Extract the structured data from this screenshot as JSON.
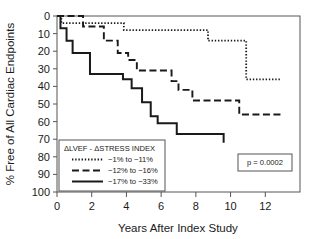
{
  "chart_data": {
    "type": "line",
    "subtype": "kaplan-meier-step",
    "title": "",
    "xlabel": "Years After Index Study",
    "ylabel": "% Free of All Cardiac Endpoints",
    "xlim": [
      0,
      14
    ],
    "ylim": [
      0,
      100
    ],
    "xticks": [
      0,
      2,
      4,
      6,
      8,
      10,
      12
    ],
    "yticks": [
      0,
      10,
      20,
      30,
      40,
      50,
      60,
      70,
      80,
      90,
      100
    ],
    "grid": false,
    "legend_position": "lower-left",
    "annotations": [
      {
        "name": "p-value",
        "text": "p = 0.0002",
        "boxed": true
      }
    ],
    "series": [
      {
        "name": "-1% to -11%",
        "style": "dotted",
        "color": "#1a1a1a",
        "points": [
          [
            0.0,
            100
          ],
          [
            0.25,
            100
          ],
          [
            0.25,
            96
          ],
          [
            3.85,
            96
          ],
          [
            3.85,
            92
          ],
          [
            8.7,
            92
          ],
          [
            8.7,
            86
          ],
          [
            10.9,
            86
          ],
          [
            10.9,
            64
          ],
          [
            12.9,
            64
          ]
        ]
      },
      {
        "name": "-12% to -16%",
        "style": "dashed",
        "color": "#1a1a1a",
        "points": [
          [
            0.0,
            100
          ],
          [
            1.5,
            100
          ],
          [
            1.5,
            94
          ],
          [
            2.7,
            94
          ],
          [
            2.7,
            86
          ],
          [
            3.5,
            86
          ],
          [
            3.5,
            79
          ],
          [
            4.1,
            79
          ],
          [
            4.1,
            75
          ],
          [
            4.6,
            75
          ],
          [
            4.6,
            69
          ],
          [
            6.6,
            69
          ],
          [
            6.6,
            63
          ],
          [
            7.0,
            63
          ],
          [
            7.0,
            58
          ],
          [
            7.8,
            58
          ],
          [
            7.8,
            52
          ],
          [
            10.5,
            52
          ],
          [
            10.5,
            44
          ],
          [
            12.9,
            44
          ]
        ]
      },
      {
        "name": "-17% to -33%",
        "style": "solid",
        "color": "#1a1a1a",
        "points": [
          [
            0.0,
            100
          ],
          [
            0.2,
            100
          ],
          [
            0.2,
            93
          ],
          [
            0.55,
            93
          ],
          [
            0.55,
            86
          ],
          [
            0.9,
            86
          ],
          [
            0.9,
            79
          ],
          [
            1.9,
            79
          ],
          [
            1.9,
            67
          ],
          [
            3.8,
            67
          ],
          [
            3.8,
            64
          ],
          [
            4.3,
            64
          ],
          [
            4.3,
            59
          ],
          [
            4.9,
            59
          ],
          [
            4.9,
            51
          ],
          [
            5.4,
            51
          ],
          [
            5.4,
            43
          ],
          [
            5.8,
            43
          ],
          [
            5.8,
            39
          ],
          [
            6.9,
            39
          ],
          [
            6.9,
            33
          ],
          [
            9.6,
            33
          ],
          [
            9.6,
            28
          ]
        ]
      }
    ]
  },
  "axes": {
    "y_tick_labels": [
      "100",
      "90",
      "80",
      "70",
      "60",
      "50",
      "40",
      "30",
      "20",
      "10",
      "0"
    ],
    "x_tick_labels": [
      "0",
      "2",
      "4",
      "6",
      "8",
      "10",
      "12"
    ],
    "y_axis_title": "% Free of All Cardiac Endpoints",
    "x_axis_title": "Years After Index Study"
  },
  "legend": {
    "title": "ΔLVEF - ΔSTRESS INDEX",
    "entries": [
      {
        "label": "−1% to −11%",
        "style": "dotted"
      },
      {
        "label": "−12% to −16%",
        "style": "dashed"
      },
      {
        "label": "−17% to −33%",
        "style": "solid"
      }
    ]
  },
  "pvalue_box": {
    "text": "p = 0.0002"
  },
  "colors": {
    "line": "#1a1a1a",
    "frame": "#555555",
    "background": "#ffffff"
  }
}
